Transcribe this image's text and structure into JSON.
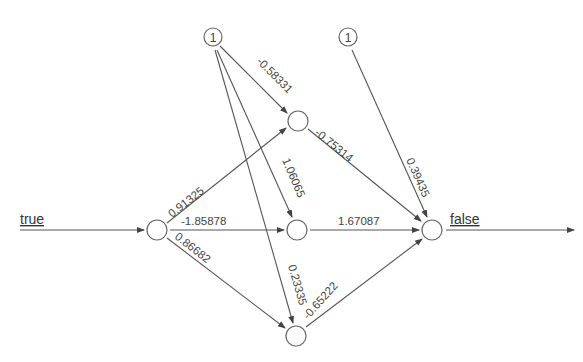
{
  "diagram": {
    "type": "neural-network",
    "input_label": "true",
    "output_label": "false",
    "bias_label": "1",
    "nodes": {
      "bias1": {
        "x": 213,
        "y": 37
      },
      "bias2": {
        "x": 348,
        "y": 37
      },
      "input": {
        "x": 157,
        "y": 230
      },
      "hidden1": {
        "x": 298,
        "y": 121
      },
      "hidden2": {
        "x": 297,
        "y": 230
      },
      "hidden3": {
        "x": 296,
        "y": 336
      },
      "output": {
        "x": 432,
        "y": 230
      }
    },
    "weights": {
      "input_hidden1": "0.91325",
      "input_hidden2": "-1.85878",
      "input_hidden3": "0.86682",
      "bias1_hidden1": "-0.58331",
      "bias1_hidden2": "1.06065",
      "bias1_hidden3": "0.23335",
      "hidden1_output": "-0.75314",
      "hidden2_output": "1.67087",
      "hidden3_output": "-0.65222",
      "bias2_output": "0.39435"
    },
    "colors": {
      "edge": "#555555",
      "node_stroke": "#666666",
      "text": "#444444"
    }
  }
}
